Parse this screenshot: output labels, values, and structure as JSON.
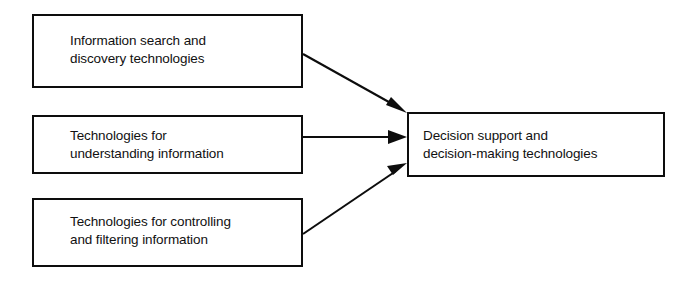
{
  "diagram": {
    "background_color": "#ffffff",
    "stroke_color": "#0d0d0d",
    "text_color": "#111111",
    "nodes": [
      {
        "id": "search",
        "name": "information-search-box",
        "label": "Information search and\ndiscovery technologies"
      },
      {
        "id": "understanding",
        "name": "understanding-information-box",
        "label": "Technologies for\nunderstanding information"
      },
      {
        "id": "controlling",
        "name": "controlling-filtering-box",
        "label": "Technologies for controlling\nand filtering information"
      },
      {
        "id": "decision",
        "name": "decision-support-box",
        "label": "Decision support and\ndecision-making technologies"
      }
    ],
    "edges": [
      {
        "id": "search-to-decision",
        "from": "search",
        "to": "decision",
        "style": "solid-arrow"
      },
      {
        "id": "understanding-to-decision",
        "from": "understanding",
        "to": "decision",
        "style": "solid-arrow"
      },
      {
        "id": "controlling-to-decision",
        "from": "controlling",
        "to": "decision",
        "style": "solid-arrow"
      }
    ]
  }
}
